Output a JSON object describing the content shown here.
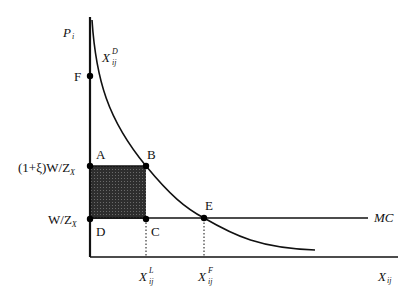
{
  "diagram": {
    "type": "economics supply-demand diagram",
    "axes": {
      "y_label": {
        "main": "P",
        "sub": "i"
      },
      "x_label": {
        "main": "X",
        "sub": "ij"
      }
    },
    "curves": {
      "demand": {
        "main": "X",
        "sub": "ij",
        "sup": "D"
      },
      "marginal_cost": "MC"
    },
    "y_ticks": {
      "upper": "(1+ξ)W/Z",
      "upper_sub": "X",
      "lower": "W/Z",
      "lower_sub": "X"
    },
    "x_ticks": [
      {
        "main": "X",
        "sub": "ij",
        "sup": "L"
      },
      {
        "main": "X",
        "sub": "ij",
        "sup": "F"
      }
    ],
    "points": [
      "F",
      "A",
      "B",
      "C",
      "D",
      "E"
    ],
    "shaded_region": "rectangle ABCD",
    "colors": {
      "line": "#111111",
      "shade": "#3a3a3a",
      "background": "#ffffff"
    }
  }
}
